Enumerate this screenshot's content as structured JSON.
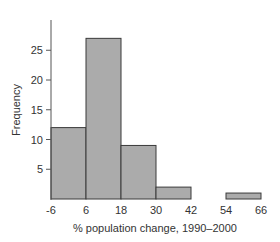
{
  "chart_data": {
    "type": "bar",
    "subtype": "histogram",
    "title": "",
    "xlabel": "% population change, 1990–2000",
    "ylabel": "Frequency",
    "bin_edges": [
      -6,
      6,
      18,
      30,
      42,
      54,
      66
    ],
    "categories": [
      "-6 to 6",
      "6 to 18",
      "18 to 30",
      "30 to 42",
      "42 to 54",
      "54 to 66"
    ],
    "values": [
      12,
      27,
      9,
      2,
      0,
      1
    ],
    "x_ticks": [
      "-6",
      "6",
      "18",
      "30",
      "42",
      "54",
      "66"
    ],
    "y_ticks": [
      "5",
      "10",
      "15",
      "20",
      "25"
    ],
    "ylim": [
      0,
      30
    ],
    "xlim": [
      -6,
      66
    ],
    "grid": false,
    "legend": null,
    "colors": {
      "bar_fill": "#ababab",
      "bar_stroke": "#3a3a3a",
      "axis": "#555555"
    }
  }
}
